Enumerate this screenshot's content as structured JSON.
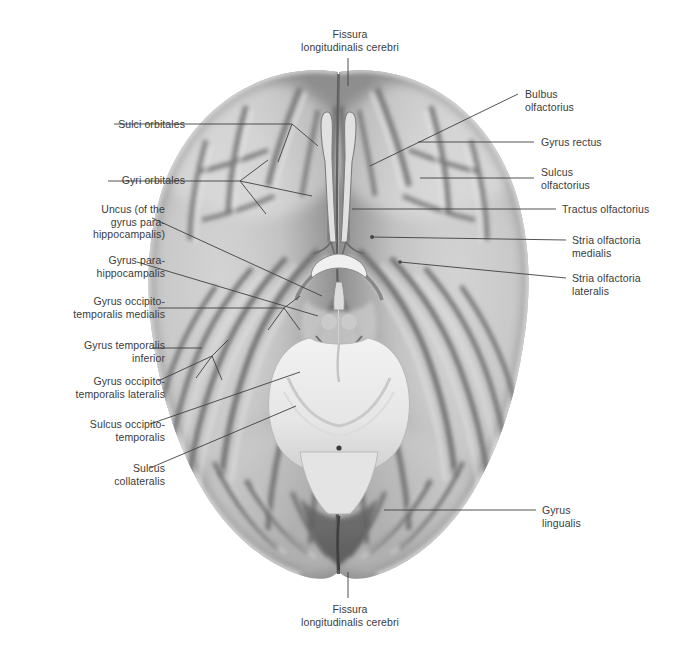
{
  "figure": {
    "title": "Fissura longitudinalis cerebri",
    "view": "Basal (inferior) view of the cerebrum",
    "colors": {
      "background": "#ffffff",
      "text": "#3b3b3b",
      "leader_line": "#3f3f3f",
      "cortex_light": "#d8d8d8",
      "cortex_mid": "#b4b4b4",
      "cortex_shadow": "#8a8a8a",
      "sulcus_dark": "#6d6d6d",
      "brainstem": "#ededed",
      "deep_shadow": "#5a5a5a"
    }
  },
  "labels": {
    "top": {
      "text": "Fissura\nlongitudinalis cerebri",
      "x": 290,
      "y": 28,
      "w": 120,
      "align": "c"
    },
    "bottom": {
      "text": "Fissura\nlongitudinalis cerebri",
      "x": 290,
      "y": 603,
      "w": 120,
      "align": "c"
    },
    "left": [
      {
        "id": "sulci-orbitales",
        "text": "Sulci orbitales",
        "x": 10,
        "y": 118,
        "w": 175,
        "align": "r"
      },
      {
        "id": "gyri-orbitales",
        "text": "Gyri orbitales",
        "x": 10,
        "y": 174,
        "w": 175,
        "align": "r"
      },
      {
        "id": "uncus",
        "text": "Uncus (of the\ngyrus para-\nhippocampalis)",
        "x": 10,
        "y": 203,
        "w": 155,
        "align": "r"
      },
      {
        "id": "gyrus-parahippocampalis",
        "text": "Gyrus para-\nhippocampalis",
        "x": 10,
        "y": 254,
        "w": 155,
        "align": "r"
      },
      {
        "id": "gyrus-occipitotemporalis-medialis",
        "text": "Gyrus occipito-\ntemporalis medialis",
        "x": 10,
        "y": 295,
        "w": 155,
        "align": "r"
      },
      {
        "id": "gyrus-temporalis-inferior",
        "text": "Gyrus temporalis\ninferior",
        "x": 10,
        "y": 339,
        "w": 155,
        "align": "r"
      },
      {
        "id": "gyrus-occipitotemporalis-lateralis",
        "text": "Gyrus occipito-\ntemporalis lateralis",
        "x": 10,
        "y": 375,
        "w": 155,
        "align": "r"
      },
      {
        "id": "sulcus-occipitotemporalis",
        "text": "Sulcus occipito-\ntemporalis",
        "x": 10,
        "y": 418,
        "w": 155,
        "align": "r"
      },
      {
        "id": "sulcus-collateralis",
        "text": "Sulcus\ncollateralis",
        "x": 10,
        "y": 462,
        "w": 155,
        "align": "r"
      }
    ],
    "right": [
      {
        "id": "bulbus-olfactorius",
        "text": "Bulbus\nolfactorius",
        "x": 525,
        "y": 88,
        "w": 145,
        "align": "l"
      },
      {
        "id": "gyrus-rectus",
        "text": "Gyrus rectus",
        "x": 541,
        "y": 136,
        "w": 135,
        "align": "l"
      },
      {
        "id": "sulcus-olfactorius",
        "text": "Sulcus\nolfactorius",
        "x": 541,
        "y": 166,
        "w": 135,
        "align": "l"
      },
      {
        "id": "tractus-olfactorius",
        "text": "Tractus olfactorius",
        "x": 562,
        "y": 203,
        "w": 115,
        "align": "l"
      },
      {
        "id": "stria-olfactoria-medialis",
        "text": "Stria olfactoria\nmedialis",
        "x": 572,
        "y": 234,
        "w": 105,
        "align": "l"
      },
      {
        "id": "stria-olfactoria-lateralis",
        "text": "Stria olfactoria\nlateralis",
        "x": 572,
        "y": 272,
        "w": 105,
        "align": "l"
      },
      {
        "id": "gyrus-lingualis",
        "text": "Gyrus\nlingualis",
        "x": 542,
        "y": 504,
        "w": 130,
        "align": "l"
      }
    ]
  },
  "anatomy": {
    "regions": [
      "frontal lobe / orbital surface",
      "temporal lobe",
      "occipital lobe",
      "olfactory bulb and tract",
      "optic chiasm",
      "mammillary bodies",
      "pons",
      "medulla oblongata",
      "cerebellum"
    ]
  }
}
